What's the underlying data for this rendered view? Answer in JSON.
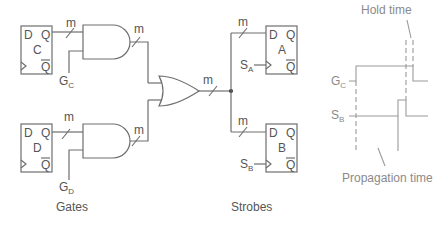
{
  "figure": {
    "sections": {
      "gates_label": "Gates",
      "strobes_label": "Strobes"
    },
    "registers": [
      {
        "id": "C",
        "d": "D",
        "q": "Q",
        "qbar": "Q",
        "name": "C"
      },
      {
        "id": "D",
        "d": "D",
        "q": "Q",
        "qbar": "Q",
        "name": "D"
      },
      {
        "id": "A",
        "d": "D",
        "q": "Q",
        "qbar": "Q",
        "name": "A"
      },
      {
        "id": "B",
        "d": "D",
        "q": "Q",
        "qbar": "Q",
        "name": "B"
      }
    ],
    "bus_width_label": "m",
    "gate_signals": {
      "gc": {
        "main": "G",
        "sub": "C"
      },
      "gd": {
        "main": "G",
        "sub": "D"
      }
    },
    "strobe_signals": {
      "sa": {
        "main": "S",
        "sub": "A"
      },
      "sb": {
        "main": "S",
        "sub": "B"
      }
    },
    "timing": {
      "hold_time_label": "Hold time",
      "propagation_time_label": "Propagation time",
      "gc": {
        "main": "G",
        "sub": "C"
      },
      "sb": {
        "main": "S",
        "sub": "B"
      }
    }
  }
}
